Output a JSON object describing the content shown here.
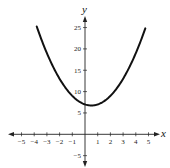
{
  "chart_data": {
    "type": "line",
    "title": "",
    "xlabel": "x",
    "ylabel": "y",
    "xlim": [
      -5.5,
      5.5
    ],
    "ylim": [
      -7,
      27
    ],
    "grid": false,
    "legend": null,
    "x_ticks": [
      -5,
      -4,
      -3,
      -2,
      -1,
      1,
      2,
      3,
      4,
      5
    ],
    "x_tick_labels": [
      "−5",
      "−4",
      "−3",
      "−2",
      "−1",
      "1",
      "2",
      "3",
      "4",
      "5"
    ],
    "y_ticks": [
      -5,
      5,
      10,
      15,
      20,
      25
    ],
    "y_tick_labels": [
      "−5",
      "5",
      "10",
      "15",
      "20",
      "25"
    ],
    "series": [
      {
        "name": "parabola",
        "description": "upward-opening parabola, vertex approx (0.5, 6.75)",
        "equation_estimate": "y = x^2 - x + 7",
        "x_range": [
          -3.8,
          4.75
        ],
        "x": [
          -3.8,
          -3,
          -2,
          -1,
          0,
          0.5,
          1,
          2,
          3,
          4,
          4.75
        ],
        "y": [
          25.24,
          19,
          13,
          9,
          7,
          6.75,
          7,
          9,
          13,
          19,
          24.81
        ]
      }
    ],
    "color": "#111111"
  },
  "layout": {
    "origin_px": [
      85,
      134.3
    ],
    "px_per_x": 12.7,
    "px_per_y": 4.27,
    "x_axis_px": [
      8,
      160
    ],
    "y_axis_px": [
      16,
      167
    ]
  }
}
